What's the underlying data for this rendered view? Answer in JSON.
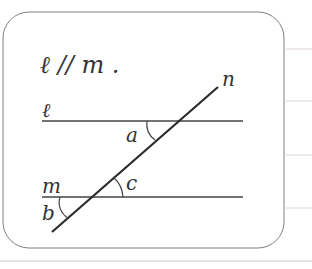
{
  "diagram": {
    "statement": "ℓ // m .",
    "lines": {
      "l": {
        "label": "ℓ",
        "y": 121,
        "x1": 42,
        "x2": 243
      },
      "m": {
        "label": "m",
        "y": 197,
        "x1": 42,
        "x2": 243
      },
      "n": {
        "label": "n",
        "x1": 52,
        "y1": 232,
        "x2": 218,
        "y2": 87
      }
    },
    "angles": {
      "a": "a",
      "b": "b",
      "c": "c"
    },
    "colors": {
      "line": "#333333",
      "frame": "#777777",
      "rule": "#d9c8cc",
      "bottom_rule": "#bbbbbb"
    }
  }
}
